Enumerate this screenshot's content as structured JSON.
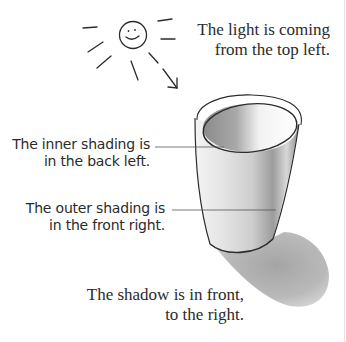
{
  "figure": {
    "annotations": {
      "light": {
        "line1": "The light is coming",
        "line2": "from the top left."
      },
      "inner_shading": {
        "line1": "The inner shading is",
        "line2": "in the back left."
      },
      "outer_shading": {
        "line1": "The outer shading is",
        "line2": "in the front right."
      },
      "shadow": {
        "line1": "The shadow is in front,",
        "line2": "to the right."
      }
    },
    "icons": {
      "sun": "smiling-sun-with-rays",
      "arrow": "light-direction-arrow",
      "cup": "shaded-cup-drawing"
    },
    "colors": {
      "ink": "#2b2b2b",
      "shading_dark": "#8c8c8c",
      "shadow": "#a9a9a9",
      "background": "#ffffff"
    }
  }
}
